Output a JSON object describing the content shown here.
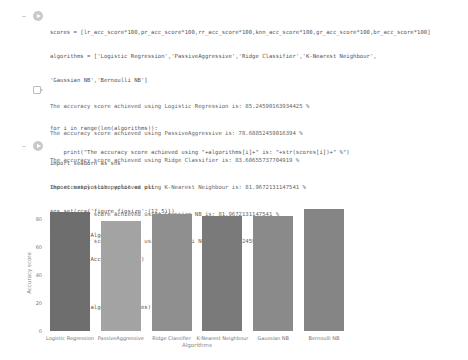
{
  "cells": [
    {
      "type": "code",
      "lines": [
        "scores = [lr_acc_score*100,pr_acc_score*100,rr_acc_score*100,knn_acc_score*100,gr_acc_score*100,br_acc_score*100]",
        "algorithms = ['Logistic Regression','PassiveAggressive','Ridge Classifier','K-Nearest Neighbour',",
        "'Gaussian NB','Bernoulli NB']",
        "",
        "for i in range(len(algorithms)):",
        "    print(\"The accuracy score achieved using \"+algorithms[i]+\" is: \"+str(scores[i])+\" %\")"
      ],
      "output": [
        "The accuracy score achieved using Logistic Regression is: 85.24590163934425 %",
        "The accuracy score achieved using PassiveAggressive is: 78.68852459016394 %",
        "The accuracy score achieved using Ridge Classifier is: 83.60655737704919 %",
        "The accuracy score achieved using K-Nearest Neighbour is: 81.9672131147541 %",
        "The accuracy score achieved using Gaussian NB is: 81.9672131147541 %",
        "The accuracy score achieved using Bernoulli NB is: 86.88524590163934 %"
      ]
    },
    {
      "type": "code",
      "lines": [
        "import seaborn as sns",
        "import matplotlib.pyplot as plt",
        "sns.set(rc={'figure.figsize':(12,5)})",
        "plt.xlabel(\"Algorithms\")",
        "plt.ylabel(\"Accuracy score\")",
        "",
        "sns.barplot(algorithms,scores)"
      ]
    }
  ],
  "colors": {
    "bars": [
      "#6e6e6e",
      "#a3a3a3",
      "#8f8f8f",
      "#7a7a7a",
      "#8a8a8a",
      "#858585"
    ],
    "code_text": "#555555",
    "output_text": "#666666"
  },
  "chart_data": {
    "type": "bar",
    "title": "",
    "xlabel": "Algorithms",
    "ylabel": "Accuracy score",
    "categories": [
      "Logistic Regression",
      "PassiveAggressive",
      "Ridge Classifier",
      "K-Nearest Neighbour",
      "Gaussian NB",
      "Bernoulli NB"
    ],
    "values": [
      85.25,
      78.69,
      83.61,
      81.97,
      81.97,
      86.89
    ],
    "yticks": [
      "0",
      "20",
      "40",
      "60",
      "80"
    ],
    "ylim": [
      0,
      90
    ],
    "grid": false,
    "legend": null
  }
}
